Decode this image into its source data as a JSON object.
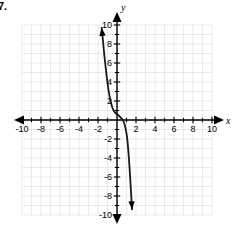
{
  "problem": {
    "number": "7."
  },
  "chart_data": {
    "type": "line",
    "title": "",
    "xlabel": "x",
    "ylabel": "y",
    "xlim": [
      -10.8,
      10.8
    ],
    "ylim": [
      -10.8,
      10.8
    ],
    "grid": true,
    "grid_step": 1,
    "legend": "none",
    "x_tick_labels": [
      "-10",
      "-8",
      "-6",
      "-4",
      "-2",
      "2",
      "4",
      "6",
      "8",
      "10"
    ],
    "x_tick_values": [
      -10,
      -8,
      -6,
      -4,
      -2,
      2,
      4,
      6,
      8,
      10
    ],
    "y_tick_labels": [
      "10",
      "8",
      "6",
      "4",
      "2",
      "-2",
      "-4",
      "-6",
      "-8",
      "-10"
    ],
    "y_tick_values": [
      10,
      8,
      6,
      4,
      2,
      -2,
      -4,
      -6,
      -8,
      -10
    ],
    "minor_tick_step": 1,
    "series": [
      {
        "name": "cubic-curve",
        "description": "decreasing cubic with inflection near (0.6, 0)",
        "arrow_start": true,
        "arrow_end": true,
        "x": [
          -1.62,
          -1.5,
          -1.4,
          -1.3,
          -1.2,
          -1.1,
          -1.0,
          -0.9,
          -0.8,
          -0.7,
          -0.6,
          -0.5,
          -0.4,
          -0.3,
          -0.2,
          -0.1,
          0.0,
          0.2,
          0.4,
          0.6,
          0.8,
          1.0,
          1.1,
          1.2,
          1.3,
          1.4,
          1.5,
          1.58
        ],
        "y": [
          9.7,
          8.6,
          7.5,
          6.5,
          5.6,
          4.7,
          3.9,
          3.2,
          2.6,
          2.1,
          1.7,
          1.35,
          1.1,
          0.92,
          0.78,
          0.68,
          0.6,
          0.45,
          0.25,
          0.0,
          -0.45,
          -1.4,
          -2.2,
          -3.3,
          -4.7,
          -6.3,
          -8.0,
          -9.4
        ]
      }
    ]
  }
}
